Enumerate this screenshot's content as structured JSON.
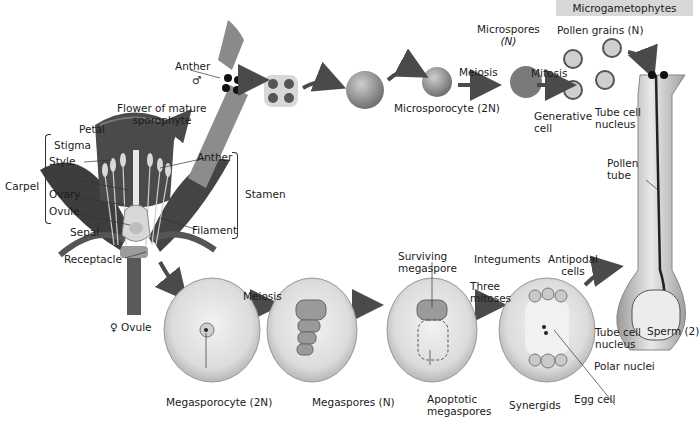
{
  "figure": {
    "header": "Microgametophytes",
    "colors": {
      "header_bg": "#d8d8d8",
      "arrow": "#4a4a4a",
      "ovule_outer": "#b9b9b9",
      "ovule_inner": "#e6e6e6",
      "flower_dark": "#3a3a3a",
      "anther": "#8c8c8c"
    }
  },
  "flower": {
    "title_line1": "Flower of mature",
    "title_line2": "sporophyte",
    "labels": {
      "petal": "Petal",
      "stigma": "Stigma",
      "style": "Style",
      "carpel": "Carpel",
      "ovary": "Ovary",
      "ovule": "Ovule",
      "sepal": "Sepal",
      "receptacle": "Receptacle",
      "anther": "Anther",
      "filament": "Filament",
      "stamen": "Stamen"
    }
  },
  "male_pathway": {
    "anther_label": "Anther",
    "male_symbol": "♂",
    "microsporocyte": "Microsporocyte (2N)",
    "meiosis": "Meiosis",
    "microspores_line1": "Microspores",
    "microspores_line2": "(N)",
    "mitosis": "Mitosis",
    "pollen_grains": "Pollen grains (N)",
    "generative_line1": "Generative",
    "generative_line2": "cell",
    "tube_nucleus_line1": "Tube cell",
    "tube_nucleus_line2": "nucleus",
    "pollen_tube_line1": "Pollen",
    "pollen_tube_line2": "tube"
  },
  "female_pathway": {
    "female_symbol": "♀",
    "ovule": "Ovule",
    "meiosis": "Meiosis",
    "megasporocyte": "Megasporocyte (2N)",
    "megaspores": "Megaspores (N)",
    "surviving_line1": "Surviving",
    "surviving_line2": "megaspore",
    "apoptotic_line1": "Apoptotic",
    "apoptotic_line2": "megaspores",
    "three_line1": "Three",
    "three_line2": "mitoses",
    "integuments": "Integuments",
    "antipodal_line1": "Antipodal",
    "antipodal_line2": "cells",
    "polar_nuclei": "Polar nuclei",
    "synergids": "Synergids",
    "egg_cell": "Egg cell",
    "tube_nucleus_line1": "Tube cell",
    "tube_nucleus_line2": "nucleus",
    "sperm": "Sperm (2)"
  }
}
